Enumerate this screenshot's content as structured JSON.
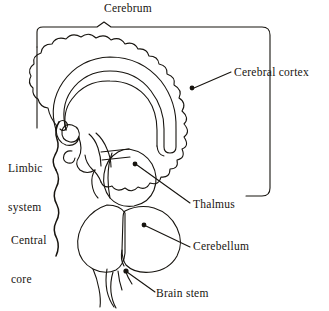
{
  "figure": {
    "type": "anatomical-diagram",
    "background_color": "#ffffff",
    "stroke_color": "#17140f"
  },
  "labels": {
    "cerebrum": "Cerebrum",
    "cerebral_cortex": "Cerebral cortex",
    "limbic_system_line1": "Limbic",
    "limbic_system_line2": "system",
    "central_core_line1": "Central",
    "central_core_line2": "core",
    "thalmus": "Thalmus",
    "cerebellum": "Cerebellum",
    "brain_stem": "Brain stem"
  },
  "annotations": {
    "cerebrum_bracket": "rounded-bracket-top",
    "limbic_system_brace": "wavy-brace-upper-left",
    "central_core_brace": "wavy-brace-lower-left",
    "cerebral_cortex_leader": "leader-line-with-dot",
    "thalmus_leader": "leader-line-with-dot",
    "cerebellum_leader": "leader-line-with-dot",
    "brain_stem_leader": "leader-line-with-dot"
  },
  "structures": [
    {
      "name": "cerebrum",
      "description": "large scalloped convoluted mass, upper brain"
    },
    {
      "name": "cerebral-cortex",
      "description": "outer scalloped surface layer of cerebrum"
    },
    {
      "name": "corpus-callosum",
      "description": "thick arched band within cerebrum"
    },
    {
      "name": "fornix-hippocampus",
      "description": "hook shaped limbic structure"
    },
    {
      "name": "thalamus",
      "description": "oval central core structure"
    },
    {
      "name": "cerebellum",
      "description": "rounded lobed structure lower right"
    },
    {
      "name": "pons",
      "description": "rounded structure lower left of cerebellum"
    },
    {
      "name": "brain-stem",
      "description": "narrow descending stalk at base"
    }
  ]
}
